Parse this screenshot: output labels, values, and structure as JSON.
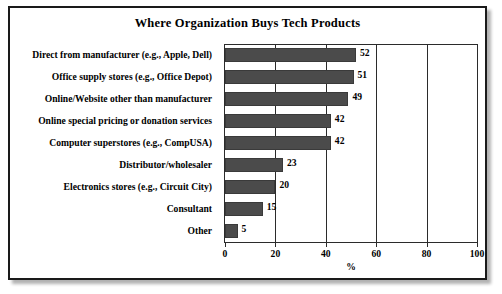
{
  "figure": {
    "title": "Where Organization Buys Tech Products",
    "border_color": "#1a1a1a",
    "background": "#ffffff"
  },
  "chart_data": {
    "type": "bar",
    "orientation": "horizontal",
    "title": "Where Organization Buys Tech Products",
    "xlabel": "%",
    "ylabel": "",
    "xlim": [
      0,
      100
    ],
    "xticks": [
      0,
      20,
      40,
      60,
      80,
      100
    ],
    "xtick_labels": [
      "0",
      "20",
      "40",
      "60",
      "80",
      "100"
    ],
    "grid": "vertical",
    "legend": "none",
    "bar_color": "#4b4b4b",
    "data_labels": true,
    "categories": [
      "Direct from manufacturer (e.g., Apple, Dell)",
      "Office supply stores (e.g., Office Depot)",
      "Online/Website other than manufacturer",
      "Online special pricing or donation services",
      "Computer superstores (e.g., CompUSA)",
      "Distributor/wholesaler",
      "Electronics stores (e.g., Circuit City)",
      "Consultant",
      "Other"
    ],
    "values": [
      52,
      51,
      49,
      42,
      42,
      23,
      20,
      15,
      5
    ],
    "value_labels": [
      "52",
      "51",
      "49",
      "42",
      "42",
      "23",
      "20",
      "15",
      "5"
    ]
  }
}
